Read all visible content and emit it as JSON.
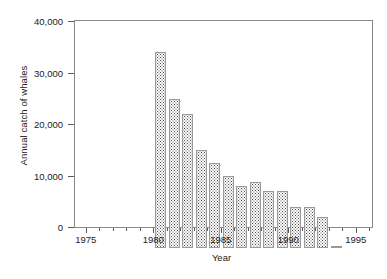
{
  "chart_data": {
    "type": "bar",
    "title": "",
    "xlabel": "Year",
    "ylabel": "Annual catch of whales",
    "categories": [
      1975,
      1976,
      1977,
      1978,
      1979,
      1980,
      1981,
      1982,
      1983,
      1984,
      1985,
      1986,
      1987,
      1988
    ],
    "values": [
      38000,
      29000,
      26000,
      19000,
      16500,
      14000,
      12000,
      12800,
      11000,
      11000,
      8000,
      8000,
      6000,
      300
    ],
    "xlim": [
      1974.2,
      1996.2
    ],
    "ylim": [
      0,
      40000
    ],
    "ytick_values": [
      0,
      10000,
      20000,
      30000,
      40000
    ],
    "ytick_labels": [
      "0",
      "10,000",
      "20,000",
      "30,000",
      "40,000"
    ],
    "xtick_major_values": [
      1975,
      1980,
      1985,
      1990,
      1995
    ],
    "xtick_major_labels": [
      "1975",
      "1980",
      "1985",
      "1990",
      "1995"
    ],
    "xtick_minor_values": [
      1976,
      1977,
      1978,
      1979,
      1981,
      1982,
      1983,
      1984,
      1986,
      1987,
      1988,
      1989,
      1991,
      1992,
      1993,
      1994,
      1996
    ],
    "grid": false,
    "legend": false,
    "bar_fill": "stippled-dots",
    "bar_edge_color": "#9a9a9a",
    "axis_color": "#8a8a8a"
  }
}
